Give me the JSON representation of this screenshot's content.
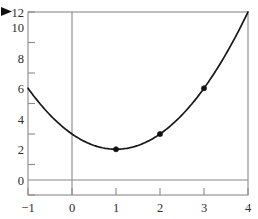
{
  "chart_data": {
    "type": "line",
    "title": "",
    "subtitle": "",
    "xlabel": "",
    "ylabel": "",
    "xlim": [
      -1,
      4
    ],
    "ylim": [
      0,
      12
    ],
    "grid": false,
    "legend": null,
    "x_ticks": [
      -1,
      0,
      1,
      2,
      3,
      4
    ],
    "x_tick_labels": [
      "−1",
      "0",
      "1",
      "2",
      "3",
      "4"
    ],
    "y_ticks": [
      0,
      2,
      4,
      6,
      8,
      10,
      12
    ],
    "y_tick_labels": [
      "0",
      "2",
      "4",
      "6",
      "8",
      "10",
      "12"
    ],
    "series": [
      {
        "name": "parabola",
        "kind": "curve",
        "expression": "y = x^2 - 2x + 4",
        "color": "#171717",
        "x": [
          -1,
          -0.75,
          -0.5,
          -0.25,
          0,
          0.25,
          0.5,
          0.75,
          1,
          1.25,
          1.5,
          1.75,
          2,
          2.25,
          2.5,
          2.75,
          3,
          3.25,
          3.5,
          3.75,
          4
        ],
        "values": [
          7,
          6.0625,
          5.25,
          4.5625,
          4,
          3.5625,
          3.25,
          3.0625,
          3,
          3.0625,
          3.25,
          3.5625,
          4,
          4.5625,
          5.25,
          6.0625,
          7,
          8.0625,
          9.25,
          10.5625,
          12
        ]
      },
      {
        "name": "marked-points",
        "kind": "scatter",
        "color": "#111111",
        "x": [
          1,
          2,
          3
        ],
        "values": [
          3,
          4,
          7
        ]
      }
    ],
    "annotations": [
      {
        "name": "pointer-arrow",
        "shape": "right-triangle",
        "near_label": "12",
        "color": "#111111"
      }
    ],
    "axis_lines": {
      "x_axis_at_y": 0,
      "y_axis_at_x": 0,
      "color": "#8a8a8a"
    },
    "frame": {
      "color": "#8a8a8a",
      "visible": true
    },
    "background": "#ffffff"
  }
}
